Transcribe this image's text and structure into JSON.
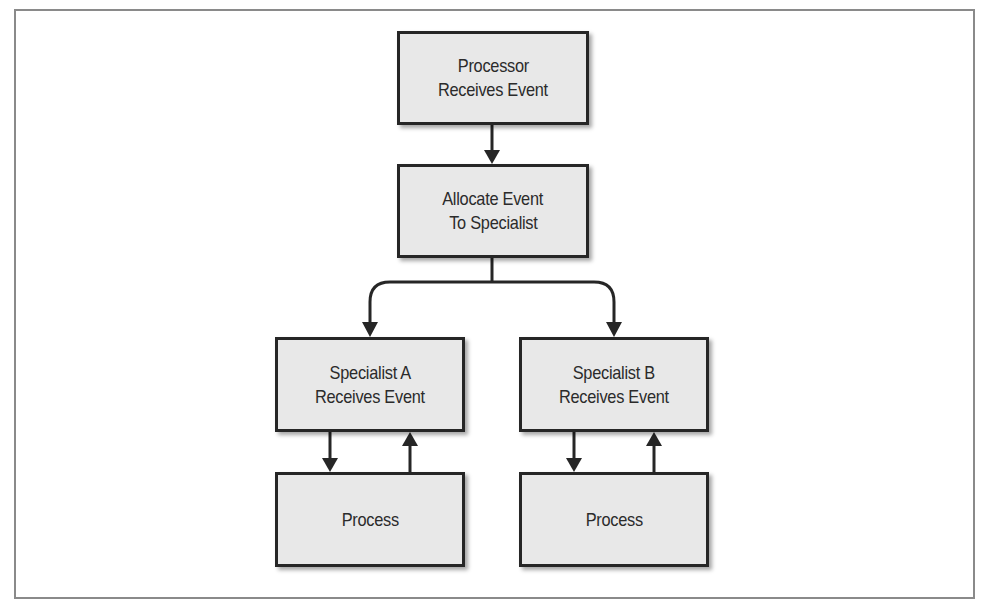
{
  "diagram": {
    "nodes": [
      {
        "id": "processor",
        "lines": [
          "Processor",
          "Receives Event"
        ]
      },
      {
        "id": "allocate",
        "lines": [
          "Allocate Event",
          "To Specialist"
        ]
      },
      {
        "id": "specialist_a",
        "lines": [
          "Specialist A",
          "Receives Event"
        ]
      },
      {
        "id": "specialist_b",
        "lines": [
          "Specialist B",
          "Receives Event"
        ]
      },
      {
        "id": "process_a",
        "lines": [
          "Process"
        ]
      },
      {
        "id": "process_b",
        "lines": [
          "Process"
        ]
      }
    ],
    "edges": [
      {
        "from": "processor",
        "to": "allocate"
      },
      {
        "from": "allocate",
        "to": "specialist_a"
      },
      {
        "from": "allocate",
        "to": "specialist_b"
      },
      {
        "from": "specialist_a",
        "to": "process_a"
      },
      {
        "from": "process_a",
        "to": "specialist_a"
      },
      {
        "from": "specialist_b",
        "to": "process_b"
      },
      {
        "from": "process_b",
        "to": "specialist_b"
      }
    ],
    "colors": {
      "box_fill": "#e8e8e8",
      "box_border": "#262626",
      "arrow": "#262626",
      "frame": "#8a8a8a"
    }
  }
}
